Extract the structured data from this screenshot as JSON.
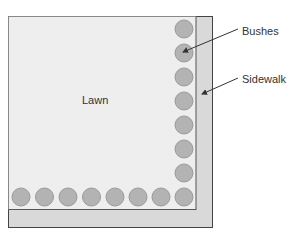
{
  "diagram": {
    "labels": {
      "lawn": "Lawn",
      "bushes": "Bushes",
      "sidewalk": "Sidewalk"
    },
    "colors": {
      "lawn": "#eeeeee",
      "sidewalk": "#d9d9d9",
      "bush_fill": "#b3b3b3",
      "bush_stroke": "#9a9a9a",
      "outline": "#444444",
      "text": "#333333"
    },
    "bushes": {
      "right_column_count": 8,
      "bottom_row_count": 8
    }
  }
}
